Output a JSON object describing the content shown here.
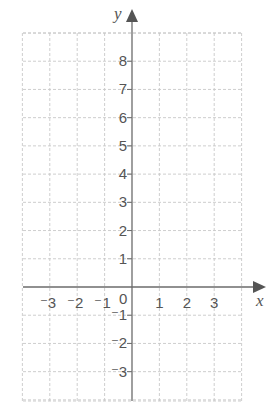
{
  "diagram": {
    "type": "coordinate-grid",
    "axes": {
      "x_label": "x",
      "y_label": "y",
      "origin_label": "0"
    },
    "x_ticks": [
      {
        "value": -3,
        "label": "⁻3"
      },
      {
        "value": -2,
        "label": "⁻2"
      },
      {
        "value": -1,
        "label": "⁻1"
      },
      {
        "value": 1,
        "label": "1"
      },
      {
        "value": 2,
        "label": "2"
      },
      {
        "value": 3,
        "label": "3"
      }
    ],
    "y_ticks": [
      {
        "value": 8,
        "label": "8"
      },
      {
        "value": 7,
        "label": "7"
      },
      {
        "value": 6,
        "label": "6"
      },
      {
        "value": 5,
        "label": "5"
      },
      {
        "value": 4,
        "label": "4"
      },
      {
        "value": 3,
        "label": "3"
      },
      {
        "value": 2,
        "label": "2"
      },
      {
        "value": 1,
        "label": "1"
      },
      {
        "value": -1,
        "label": "⁻1"
      },
      {
        "value": -2,
        "label": "⁻2"
      },
      {
        "value": -3,
        "label": "⁻3"
      }
    ],
    "x_range": [
      -4,
      4
    ],
    "y_range": [
      -4,
      9
    ],
    "grid": "dashed",
    "colors": {
      "axis": "#6b6b6b",
      "grid": "#c8c8c8",
      "text": "#555555"
    }
  }
}
